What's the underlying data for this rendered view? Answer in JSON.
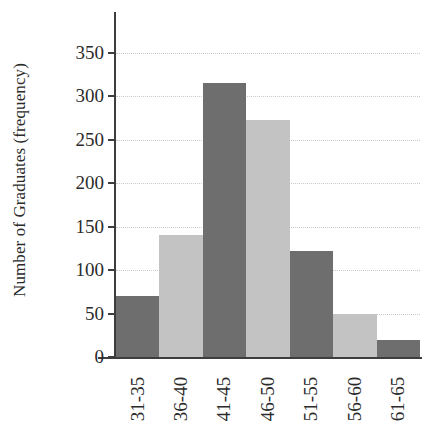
{
  "chart_data": {
    "type": "bar",
    "title": "",
    "subtitle": "",
    "xlabel": "",
    "ylabel": "Number of Graduates (frequency)",
    "categories": [
      "31-35",
      "36-40",
      "41-45",
      "46-50",
      "51-55",
      "56-60",
      "61-65"
    ],
    "values": [
      70,
      140,
      316,
      273,
      122,
      50,
      20
    ],
    "ylim": [
      0,
      350
    ],
    "ytick_labels": [
      "0",
      "50",
      "100",
      "150",
      "200",
      "250",
      "300",
      "350"
    ],
    "ytick_values": [
      0,
      50,
      100,
      150,
      200,
      250,
      300,
      350
    ],
    "grid": "horizontal-dotted",
    "legend": "none",
    "bar_gap": 0,
    "bar_colors": [
      "#6e6e6e",
      "#c3c3c3",
      "#6e6e6e",
      "#c3c3c3",
      "#6e6e6e",
      "#c3c3c3",
      "#6e6e6e"
    ],
    "colors": {
      "bar_dark": "#6e6e6e",
      "bar_light": "#c3c3c3",
      "axis": "#3d3d3d",
      "grid": "#c9c9c9",
      "text": "#2b2b2b",
      "background": "#ffffff"
    }
  }
}
